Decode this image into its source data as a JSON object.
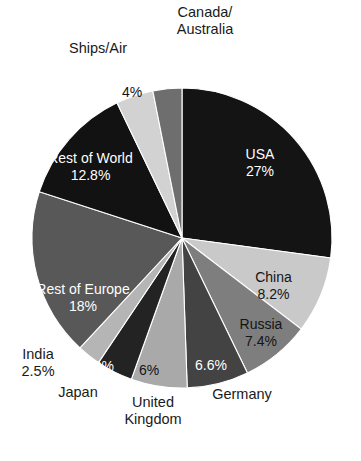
{
  "chart_data": {
    "type": "pie",
    "title": "",
    "subtitle": "",
    "xlabel": "",
    "ylabel": "",
    "legend_position": "none",
    "grid": false,
    "start_angle_deg": 0,
    "direction": "clockwise",
    "categories": [
      "USA",
      "China",
      "Russia",
      "Germany",
      "United Kingdom",
      "Japan",
      "India",
      "Rest of Europe",
      "Rest of World",
      "Ships/Air",
      "Canada/Australia"
    ],
    "values": [
      27,
      8.2,
      7.4,
      6.6,
      6,
      3.9,
      2.5,
      18,
      12.8,
      4,
      3.1
    ],
    "value_labels": [
      "27%",
      "8.2%",
      "7.4%",
      "6.6%",
      "6%",
      "3.9%",
      "2.5%",
      "18%",
      "12.8%",
      "4%",
      "3.1%"
    ],
    "colors": [
      "#141414",
      "#c9c9c9",
      "#7e7e7e",
      "#434343",
      "#a9a9a9",
      "#232323",
      "#b5b5b5",
      "#585858",
      "#121212",
      "#d2d2d2",
      "#6e6e6e"
    ],
    "slices": [
      {
        "name": "USA",
        "value": 27,
        "value_label": "27%",
        "color": "#141414",
        "name_placement": "inside",
        "value_placement": "inside",
        "text_color": "light"
      },
      {
        "name": "China",
        "value": 8.2,
        "value_label": "8.2%",
        "color": "#c9c9c9",
        "name_placement": "inside",
        "value_placement": "inside",
        "text_color": "dark"
      },
      {
        "name": "Russia",
        "value": 7.4,
        "value_label": "7.4%",
        "color": "#7e7e7e",
        "name_placement": "inside",
        "value_placement": "inside",
        "text_color": "dark"
      },
      {
        "name": "Germany",
        "value": 6.6,
        "value_label": "6.6%",
        "color": "#434343",
        "name_placement": "outside",
        "value_placement": "inside",
        "text_color": "light"
      },
      {
        "name": "United Kingdom",
        "value": 6,
        "value_label": "6%",
        "color": "#a9a9a9",
        "name_placement": "outside",
        "value_placement": "inside",
        "text_color": "dark"
      },
      {
        "name": "Japan",
        "value": 3.9,
        "value_label": "3.9%",
        "color": "#232323",
        "name_placement": "outside",
        "value_placement": "inside",
        "text_color": "light"
      },
      {
        "name": "India",
        "value": 2.5,
        "value_label": "2.5%",
        "color": "#b5b5b5",
        "name_placement": "outside",
        "value_placement": "outside",
        "text_color": "dark"
      },
      {
        "name": "Rest of Europe",
        "value": 18,
        "value_label": "18%",
        "color": "#585858",
        "name_placement": "inside",
        "value_placement": "inside",
        "text_color": "light"
      },
      {
        "name": "Rest of World",
        "value": 12.8,
        "value_label": "12.8%",
        "color": "#121212",
        "name_placement": "inside",
        "value_placement": "inside",
        "text_color": "light"
      },
      {
        "name": "Ships/Air",
        "value": 4,
        "value_label": "4%",
        "color": "#d2d2d2",
        "name_placement": "outside",
        "value_placement": "inside",
        "text_color": "dark"
      },
      {
        "name": "Canada/Australia",
        "value": 3.1,
        "value_label": "3.1%",
        "color": "#6e6e6e",
        "name_placement": "outside",
        "value_placement": "inside",
        "text_color": "light"
      }
    ]
  },
  "labels": {
    "canada_australia_line1": "Canada/",
    "canada_australia_line2": "Australia",
    "ships_air": "Ships/Air",
    "ships_air_value": "4%",
    "canada_australia_value": "3.1%",
    "usa_name": "USA",
    "usa_value": "27%",
    "china_name": "China",
    "china_value": "8.2%",
    "russia_name": "Russia",
    "russia_value": "7.4%",
    "germany_name": "Germany",
    "germany_value": "6.6%",
    "uk_line1": "United",
    "uk_line2": "Kingdom",
    "uk_value": "6%",
    "japan_name": "Japan",
    "japan_value": "3.9%",
    "india_name": "India",
    "india_value": "2.5%",
    "rest_of_europe_name": "Rest of Europe",
    "rest_of_europe_value": "18%",
    "rest_of_world_name": "Rest of World",
    "rest_of_world_value": "12.8%"
  },
  "geometry": {
    "center_x": 182,
    "center_y": 238,
    "radius": 150
  }
}
